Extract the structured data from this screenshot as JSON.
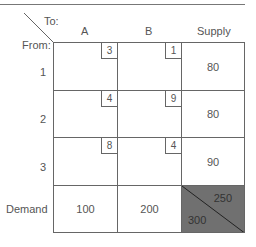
{
  "header": {
    "to_label": "To:",
    "from_label": "From:",
    "columns": [
      "A",
      "B"
    ],
    "supply_label": "Supply"
  },
  "rows": [
    {
      "label": "1",
      "costs": [
        "3",
        "1"
      ],
      "supply": "80"
    },
    {
      "label": "2",
      "costs": [
        "4",
        "9"
      ],
      "supply": "80"
    },
    {
      "label": "3",
      "costs": [
        "8",
        "4"
      ],
      "supply": "90"
    }
  ],
  "demand": {
    "label": "Demand",
    "values": [
      "100",
      "200"
    ]
  },
  "totals": {
    "supply_total": "250",
    "demand_total": "300",
    "corner_color": "#707070"
  }
}
